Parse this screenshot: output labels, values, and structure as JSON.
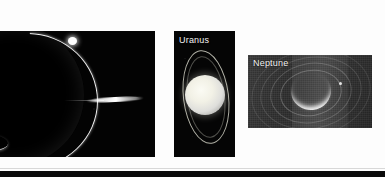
{
  "slide": {
    "background_color": "#fdfdfd",
    "bottom_band_color": "#0a0a0a"
  },
  "panels": [
    {
      "id": "ring-image-left",
      "name": "jupiter-ring-image",
      "label": "",
      "label_color": "#f2f2f2",
      "background_color": "#030303",
      "description": "Dark backlit image of a giant planet limb with a bright curving ring arc, a bright knot at the arc top, faint lower-left ring segments and a bright edge-on ring ansa streak at right",
      "cropped_left": true
    },
    {
      "id": "ring-image-uranus",
      "name": "uranus-ring-image",
      "label": "Uranus",
      "label_color": "#f2f2f2",
      "background_color": "#050505",
      "description": "Bright pale featureless disc of Uranus centred in a black field, encircled by a thin near-vertical elliptical ring visible above and below the planet"
    },
    {
      "id": "ring-image-neptune",
      "name": "neptune-ring-image",
      "label": "Neptune",
      "label_color": "#f2f2f2",
      "background_color": "#2b2b2b",
      "description": "Grainy grey long-exposure image showing a bright thin crescent of Neptune with faint concentric ring arcs and a small moon point to the right"
    }
  ]
}
